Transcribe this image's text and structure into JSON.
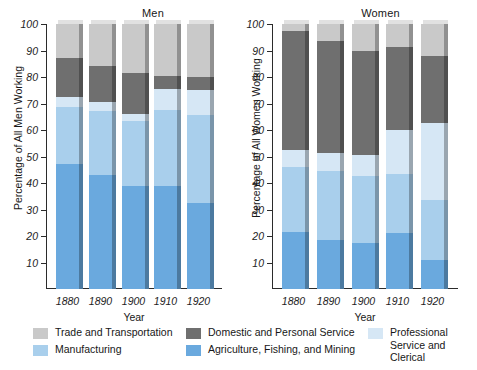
{
  "chart_data": {
    "type": "bar",
    "subtype": "stacked-bar",
    "title": "",
    "panels": [
      {
        "name": "men",
        "title": "Men",
        "ylabel": "Percentage of All Men Working",
        "xlabel": "Year",
        "categories": [
          "1880",
          "1890",
          "1900",
          "1910",
          "1920"
        ],
        "ylim": [
          0,
          100
        ],
        "yticks": [
          10,
          20,
          30,
          40,
          50,
          60,
          70,
          80,
          90,
          100
        ],
        "series": [
          {
            "name": "Agriculture, Fishing, and Mining",
            "values": [
              47,
              43,
              39,
              39,
              32.5
            ]
          },
          {
            "name": "Manufacturing",
            "values": [
              21.5,
              24,
              24.5,
              28.5,
              33
            ]
          },
          {
            "name": "Professional Service and Clerical",
            "values": [
              4,
              3.5,
              2.5,
              8,
              9.5
            ]
          },
          {
            "name": "Domestic and Personal Service",
            "values": [
              14.5,
              13.5,
              15.5,
              5,
              5
            ]
          },
          {
            "name": "Trade and Transportation",
            "values": [
              13,
              16,
              18.5,
              19.5,
              20
            ]
          }
        ],
        "cumulative_tops": {
          "1880": [
            47,
            68.5,
            72.5,
            87,
            100
          ],
          "1890": [
            43,
            67,
            70.5,
            84,
            100
          ],
          "1900": [
            39,
            63.5,
            66,
            81.5,
            100
          ],
          "1910": [
            39,
            67.5,
            75.5,
            80.5,
            100
          ],
          "1920": [
            32.5,
            65.5,
            75,
            80,
            100
          ]
        }
      },
      {
        "name": "women",
        "title": "Women",
        "ylabel": "Percentage of All Women Working",
        "xlabel": "Year",
        "categories": [
          "1880",
          "1890",
          "1900",
          "1910",
          "1920"
        ],
        "ylim": [
          0,
          100
        ],
        "yticks": [
          10,
          20,
          30,
          40,
          50,
          60,
          70,
          80,
          90,
          100
        ],
        "series": [
          {
            "name": "Agriculture, Fishing, and Mining",
            "values": [
              21.5,
              18.5,
              17.5,
              21,
              11
            ]
          },
          {
            "name": "Manufacturing",
            "values": [
              24.5,
              26,
              25,
              22.5,
              22.5
            ]
          },
          {
            "name": "Professional Service and Clerical",
            "values": [
              6.5,
              7,
              8,
              16.5,
              29
            ]
          },
          {
            "name": "Domestic and Personal Service",
            "values": [
              45,
              41.5,
              39.5,
              31.5,
              25.5
            ]
          },
          {
            "name": "Trade and Transportation",
            "values": [
              2.5,
              6.5,
              10,
              8.5,
              12
            ]
          }
        ],
        "cumulative_tops": {
          "1880": [
            21.5,
            46,
            52.5,
            97.5,
            100
          ],
          "1890": [
            18.5,
            44.5,
            51.5,
            93.5,
            100
          ],
          "1900": [
            17.5,
            42.5,
            50.5,
            90,
            100
          ],
          "1910": [
            21,
            43.5,
            60,
            91.5,
            100
          ],
          "1920": [
            11,
            33.5,
            62.5,
            88,
            100
          ]
        }
      }
    ],
    "legend": {
      "position": "bottom",
      "entries": [
        {
          "label": "Trade and Transportation",
          "color": "#c9c9c9"
        },
        {
          "label": "Manufacturing",
          "color": "#a9cfec"
        },
        {
          "label": "Domestic and Personal Service",
          "color": "#6f6f6f"
        },
        {
          "label": "Agriculture, Fishing, and Mining",
          "color": "#6aa9de"
        },
        {
          "label": "Professional Service and Clerical",
          "color": "#d6e7f5"
        }
      ]
    },
    "colors": {
      "trade_and_transportation": "#c9c9c9",
      "domestic_and_personal_service": "#6f6f6f",
      "professional_service_and_clerical": "#d6e7f5",
      "manufacturing": "#a9cfec",
      "agriculture_fishing_and_mining": "#6aa9de",
      "axis": "#2b2b2b",
      "text": "#171717",
      "background": "#ffffff"
    }
  }
}
